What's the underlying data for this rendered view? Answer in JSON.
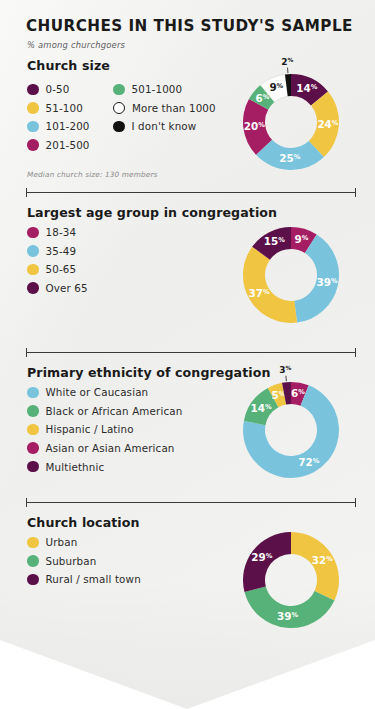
{
  "header": {
    "title": "CHURCHES IN THIS STUDY'S SAMPLE",
    "subtitle": "% among churchgoers"
  },
  "palette": {
    "dark_purple": "#5C1049",
    "yellow": "#EFC541",
    "light_blue": "#79C4DC",
    "magenta": "#A51E63",
    "green": "#57B27A",
    "white": "#FFFFFF",
    "black": "#111111",
    "ink": "#1a1a1a",
    "card_bg": "#F1F1EF"
  },
  "sections": [
    {
      "id": "church-size",
      "title": "Church size",
      "footnote": "Median church size: 130 members",
      "legend_columns": [
        [
          {
            "label": "0-50",
            "color": "#5C1049",
            "hollow": false
          },
          {
            "label": "51-100",
            "color": "#EFC541",
            "hollow": false
          },
          {
            "label": "101-200",
            "color": "#79C4DC",
            "hollow": false
          },
          {
            "label": "201-500",
            "color": "#A51E63",
            "hollow": false
          }
        ],
        [
          {
            "label": "501-1000",
            "color": "#57B27A",
            "hollow": false
          },
          {
            "label": "More than 1000",
            "color": "#FFFFFF",
            "hollow": true
          },
          {
            "label": "I don't know",
            "color": "#111111",
            "hollow": false
          }
        ]
      ]
    },
    {
      "id": "largest-age-group",
      "title": "Largest age group in congregation",
      "footnote": "",
      "legend_columns": [
        [
          {
            "label": "18-34",
            "color": "#A51E63",
            "hollow": false
          },
          {
            "label": "35-49",
            "color": "#79C4DC",
            "hollow": false
          },
          {
            "label": "50-65",
            "color": "#EFC541",
            "hollow": false
          },
          {
            "label": "Over 65",
            "color": "#5C1049",
            "hollow": false
          }
        ]
      ]
    },
    {
      "id": "primary-ethnicity",
      "title": "Primary ethnicity of congregation",
      "footnote": "",
      "legend_columns": [
        [
          {
            "label": "White or Caucasian",
            "color": "#79C4DC",
            "hollow": false
          },
          {
            "label": "Black or African American",
            "color": "#57B27A",
            "hollow": false
          },
          {
            "label": "Hispanic / Latino",
            "color": "#EFC541",
            "hollow": false
          },
          {
            "label": "Asian or Asian American",
            "color": "#A51E63",
            "hollow": false
          },
          {
            "label": "Multiethnic",
            "color": "#5C1049",
            "hollow": false
          }
        ]
      ]
    },
    {
      "id": "church-location",
      "title": "Church location",
      "footnote": "",
      "legend_columns": [
        [
          {
            "label": "Urban",
            "color": "#EFC541",
            "hollow": false
          },
          {
            "label": "Suburban",
            "color": "#57B27A",
            "hollow": false
          },
          {
            "label": "Rural / small town",
            "color": "#5C1049",
            "hollow": false
          }
        ]
      ]
    }
  ],
  "chart_data": [
    {
      "type": "pie",
      "variant": "donut",
      "title": "Church size",
      "subtitle": "% among churchgoers",
      "note": "Median church size: 130 members",
      "categories": [
        "0-50",
        "51-100",
        "101-200",
        "201-500",
        "501-1000",
        "More than 1000",
        "I don't know"
      ],
      "values": [
        14,
        24,
        25,
        20,
        6,
        9,
        2
      ],
      "colors": [
        "#5C1049",
        "#EFC541",
        "#79C4DC",
        "#A51E63",
        "#57B27A",
        "#FFFFFF",
        "#111111"
      ],
      "label_colors": [
        "#FFFFFF",
        "#FFFFFF",
        "#FFFFFF",
        "#FFFFFF",
        "#FFFFFF",
        "#1a1a1a",
        "#1a1a1a"
      ],
      "labels": [
        "14%",
        "24%",
        "25%",
        "20%",
        "6%",
        "9%",
        "2%"
      ],
      "start_angle_deg": 0,
      "legend_position": "left"
    },
    {
      "type": "pie",
      "variant": "donut",
      "title": "Largest age group in congregation",
      "categories": [
        "18-34",
        "35-49",
        "50-65",
        "Over 65"
      ],
      "values": [
        9,
        39,
        37,
        15
      ],
      "colors": [
        "#A51E63",
        "#79C4DC",
        "#EFC541",
        "#5C1049"
      ],
      "label_colors": [
        "#FFFFFF",
        "#FFFFFF",
        "#FFFFFF",
        "#FFFFFF"
      ],
      "labels": [
        "9%",
        "39%",
        "37%",
        "15%"
      ],
      "start_angle_deg": 0,
      "legend_position": "left"
    },
    {
      "type": "pie",
      "variant": "donut",
      "title": "Primary ethnicity of congregation",
      "categories": [
        "Asian or Asian American",
        "White or Caucasian",
        "Black or African American",
        "Hispanic / Latino",
        "Multiethnic"
      ],
      "values": [
        6,
        72,
        14,
        5,
        3
      ],
      "colors": [
        "#A51E63",
        "#79C4DC",
        "#57B27A",
        "#EFC541",
        "#5C1049"
      ],
      "label_colors": [
        "#FFFFFF",
        "#FFFFFF",
        "#FFFFFF",
        "#FFFFFF",
        "#1a1a1a"
      ],
      "labels": [
        "6%",
        "72%",
        "14%",
        "5%",
        "3%"
      ],
      "start_angle_deg": 0,
      "legend_position": "left"
    },
    {
      "type": "pie",
      "variant": "donut",
      "title": "Church location",
      "categories": [
        "Urban",
        "Suburban",
        "Rural / small town"
      ],
      "values": [
        32,
        39,
        29
      ],
      "colors": [
        "#EFC541",
        "#57B27A",
        "#5C1049"
      ],
      "label_colors": [
        "#FFFFFF",
        "#FFFFFF",
        "#FFFFFF"
      ],
      "labels": [
        "32%",
        "39%",
        "29%"
      ],
      "start_angle_deg": 0,
      "legend_position": "left"
    }
  ]
}
